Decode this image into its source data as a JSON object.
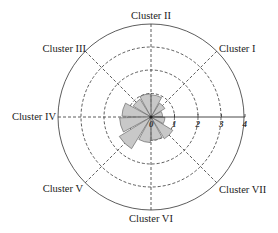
{
  "chart_data": {
    "type": "rose",
    "title": "",
    "radial_axis": {
      "min": 0,
      "max": 4,
      "ticks": [
        0,
        1,
        2,
        3,
        4
      ],
      "tick_labels": [
        "0",
        "1",
        "2",
        "3",
        "4"
      ]
    },
    "grid": {
      "circles": [
        1,
        2,
        3
      ],
      "outer": 4,
      "style": "dashed"
    },
    "cluster_labels": [
      {
        "name": "Cluster I",
        "angle": 45
      },
      {
        "name": "Cluster II",
        "angle": 90
      },
      {
        "name": "Cluster III",
        "angle": 135
      },
      {
        "name": "Cluster IV",
        "angle": 180
      },
      {
        "name": "Cluster V",
        "angle": 225
      },
      {
        "name": "Cluster VI",
        "angle": 270
      },
      {
        "name": "Cluster VII",
        "angle": 315
      }
    ],
    "sector_width_deg": 30,
    "sectors": [
      {
        "angle": 15,
        "value": 0.5
      },
      {
        "angle": 45,
        "value": 0.7
      },
      {
        "angle": 75,
        "value": 0.95
      },
      {
        "angle": 105,
        "value": 1.0
      },
      {
        "angle": 135,
        "value": 0.9
      },
      {
        "angle": 165,
        "value": 1.25
      },
      {
        "angle": 195,
        "value": 1.35
      },
      {
        "angle": 225,
        "value": 1.6
      },
      {
        "angle": 255,
        "value": 1.1
      },
      {
        "angle": 285,
        "value": 1.0
      },
      {
        "angle": 315,
        "value": 1.1
      },
      {
        "angle": 345,
        "value": 0.6
      }
    ],
    "colors": {
      "petal_fill": "#c8c8c8",
      "petal_stroke": "#555555",
      "grid": "#333333"
    }
  },
  "labels": {
    "c1": "Cluster I",
    "c2": "Cluster II",
    "c3": "Cluster III",
    "c4": "Cluster IV",
    "c5": "Cluster V",
    "c6": "Cluster VI",
    "c7": "Cluster VII",
    "t0": "0",
    "t1": "1",
    "t2": "2",
    "t3": "3",
    "t4": "4"
  }
}
